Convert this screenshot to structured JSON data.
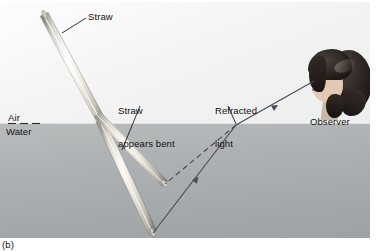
{
  "figure": {
    "caption": "(b)",
    "regions": {
      "air_label": "Air",
      "water_label": "Water",
      "air_color": "#f4f4f4",
      "water_color": "#aeb1b3",
      "surface_y": 121
    },
    "labels": {
      "straw": "Straw",
      "straw_appears_bent_line1": "Straw",
      "straw_appears_bent_line2": "appears bent",
      "refracted_light_line1": "Refracted",
      "refracted_light_line2": "light",
      "observer": "Observer"
    },
    "leader_lines": [
      {
        "name": "straw-leader",
        "x1": 86,
        "y1": 16,
        "x2": 62,
        "y2": 30
      },
      {
        "name": "straw-bent-leader",
        "x1": 139,
        "y1": 103,
        "x2": 122,
        "y2": 147
      },
      {
        "name": "refracted-light-leader",
        "x1": 228,
        "y1": 103,
        "x2": 236,
        "y2": 122
      }
    ],
    "straw": {
      "actual": {
        "x1": 44,
        "y1": 12,
        "x2": 152,
        "y2": 230,
        "color": "#e9e6df"
      },
      "apparent": {
        "x1": 100,
        "y1": 112,
        "x2": 164,
        "y2": 181,
        "color": "#eeebe4"
      }
    },
    "rays": {
      "actual_ray_color": "#4a4a52",
      "apparent_ray_color": "#4a4a52",
      "incident": {
        "x1": 152,
        "y1": 230,
        "x2": 236,
        "y2": 123,
        "style": "solid",
        "arrow": true
      },
      "refracted": {
        "x1": 236,
        "y1": 123,
        "x2": 312,
        "y2": 79,
        "style": "solid",
        "arrow": true
      },
      "apparent": {
        "x1": 164,
        "y1": 181,
        "x2": 236,
        "y2": 123,
        "style": "dashed",
        "arrow": false
      },
      "sight_to_eye": {
        "x1": 236,
        "y1": 123,
        "x2": 313,
        "y2": 80
      }
    }
  }
}
